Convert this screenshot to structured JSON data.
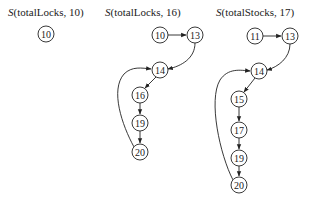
{
  "graphs": [
    {
      "title_prefix": "S",
      "title_rest": "(totalLocks, 10)",
      "title_x": 8,
      "nodes": [
        {
          "id": "10",
          "label": "10",
          "x": 46,
          "y": 34
        }
      ],
      "edges": []
    },
    {
      "title_prefix": "S",
      "title_rest": "(totalLocks, 16)",
      "title_x": 105,
      "nodes": [
        {
          "id": "10",
          "label": "10",
          "x": 160,
          "y": 35
        },
        {
          "id": "13",
          "label": "13",
          "x": 195,
          "y": 35
        },
        {
          "id": "14",
          "label": "14",
          "x": 160,
          "y": 70
        },
        {
          "id": "16",
          "label": "16",
          "x": 140,
          "y": 95
        },
        {
          "id": "19",
          "label": "19",
          "x": 140,
          "y": 123
        },
        {
          "id": "20",
          "label": "20",
          "x": 140,
          "y": 152
        }
      ],
      "edges": [
        {
          "from": "10",
          "to": "13"
        },
        {
          "from": "13",
          "to": "14"
        },
        {
          "from": "14",
          "to": "16"
        },
        {
          "from": "16",
          "to": "19"
        },
        {
          "from": "19",
          "to": "20"
        },
        {
          "from": "20",
          "to": "14"
        }
      ]
    },
    {
      "title_prefix": "S",
      "title_rest": "(totalStocks, 17)",
      "title_x": 216,
      "nodes": [
        {
          "id": "11",
          "label": "11",
          "x": 255,
          "y": 36
        },
        {
          "id": "13",
          "label": "13",
          "x": 290,
          "y": 36
        },
        {
          "id": "14",
          "label": "14",
          "x": 259,
          "y": 71
        },
        {
          "id": "15",
          "label": "15",
          "x": 239,
          "y": 99
        },
        {
          "id": "17",
          "label": "17",
          "x": 239,
          "y": 130
        },
        {
          "id": "19",
          "label": "19",
          "x": 239,
          "y": 158
        },
        {
          "id": "20",
          "label": "20",
          "x": 239,
          "y": 185
        }
      ],
      "edges": [
        {
          "from": "11",
          "to": "13"
        },
        {
          "from": "13",
          "to": "14"
        },
        {
          "from": "14",
          "to": "15"
        },
        {
          "from": "15",
          "to": "17"
        },
        {
          "from": "17",
          "to": "19"
        },
        {
          "from": "19",
          "to": "20"
        },
        {
          "from": "20",
          "to": "14"
        }
      ]
    }
  ]
}
